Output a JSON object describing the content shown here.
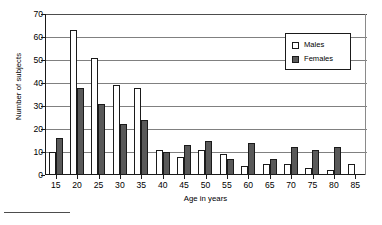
{
  "chart_data": {
    "type": "bar",
    "title": "",
    "xlabel": "Age in years",
    "ylabel": "Number of subjects",
    "categories": [
      "15",
      "20",
      "25",
      "30",
      "35",
      "40",
      "45",
      "50",
      "55",
      "60",
      "65",
      "70",
      "75",
      "80",
      "85"
    ],
    "series": [
      {
        "name": "Males",
        "color": "#ffffff",
        "values": [
          10,
          63,
          51,
          39,
          38,
          11,
          8,
          11,
          9,
          4,
          5,
          5,
          3,
          2,
          5
        ]
      },
      {
        "name": "Females",
        "color": "#595959",
        "values": [
          16,
          38,
          31,
          22,
          24,
          10,
          13,
          15,
          7,
          14,
          7,
          12,
          11,
          12,
          0
        ]
      }
    ],
    "ylim": [
      0,
      70
    ],
    "yticks": [
      0,
      10,
      20,
      30,
      40,
      50,
      60,
      70
    ],
    "ytick_labels": [
      "0",
      "10",
      "20",
      "30",
      "40",
      "50",
      "60",
      "70"
    ],
    "grid": true,
    "grid_axis": "y",
    "legend_position": "upper right",
    "legend_entries": [
      "Males",
      "Females"
    ]
  }
}
